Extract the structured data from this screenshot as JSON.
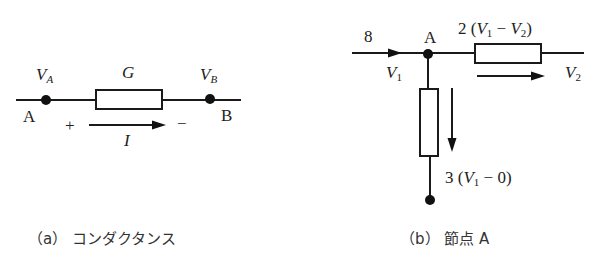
{
  "figure_a": {
    "caption": "（a） コンダクタンス",
    "node_left_label": "A",
    "node_right_label": "B",
    "voltage_left": "V",
    "voltage_left_sub": "A",
    "voltage_right": "V",
    "voltage_right_sub": "B",
    "conductance_label": "G",
    "current_label": "I",
    "plus_sign": "+",
    "minus_sign": "−"
  },
  "figure_b": {
    "caption": "（b） 節点 A",
    "node_label": "A",
    "input_current": "8",
    "voltage_1": "V",
    "voltage_1_sub": "1",
    "voltage_2": "V",
    "voltage_2_sub": "2",
    "branch_right_current": "2 (V₁ − V₂)",
    "branch_right_prefix": "2 (",
    "branch_right_mid": " − ",
    "branch_right_suffix": ")",
    "branch_down_prefix": "3 (",
    "branch_down_suffix": " − 0)"
  },
  "colors": {
    "line": "#1a1a1a",
    "background": "#ffffff"
  }
}
